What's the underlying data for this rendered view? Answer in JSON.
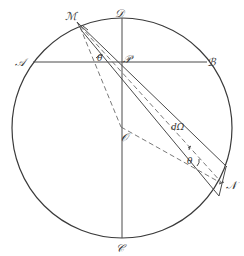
{
  "figure": {
    "labels": {
      "A": "𝒜",
      "B": "ℬ",
      "C": "𝒞",
      "D": "𝒟",
      "M": "ℳ",
      "N": "𝒩",
      "P": "𝒫",
      "O": "𝒪",
      "theta_M": "θ",
      "theta_N": "θ",
      "solid_angle": "dΩ"
    },
    "colors": {
      "ink": "#3a3a3a",
      "background": "#ffffff"
    }
  }
}
